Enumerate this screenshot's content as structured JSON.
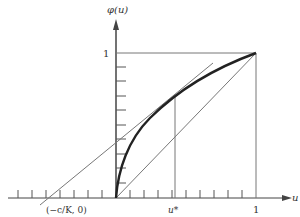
{
  "diagram": {
    "y_axis_label": "φ(u)",
    "x_axis_label": "u",
    "y_tick_one_label": "1",
    "x_tick_one_label": "1",
    "u_star_label": "u*",
    "intercept_label": "(−c/K, 0)"
  },
  "elements": {
    "curve": "concave increasing curve φ(u) from (0,0) to (1,1)",
    "diagonal": "line φ = u from (0,0) to (1,1)",
    "tangent": "tangent line to φ at u*, crossing x-axis at (−c/K, 0)",
    "box": "unit square guide lines at u=1 and φ=1",
    "u_star_line": "vertical line at u* up to curve"
  },
  "colors": {
    "ink": "#333333",
    "thin": "#666666"
  }
}
